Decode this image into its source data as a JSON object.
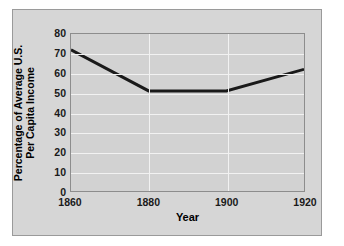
{
  "figure": {
    "panel_bg": "#d6d6d6",
    "plot_bg": "#d2d2d2",
    "grid_color": "#f2f2f2",
    "line_color": "#1a1a1a",
    "axis_color": "#8d8d8d",
    "caption_sliver": "............ ... .... .... ..... ...... ...."
  },
  "chart_data": {
    "type": "line",
    "title": "",
    "subtitle": "",
    "xlabel": "Year",
    "ylabel": "Percentage of Average U.S. Per Capita Income",
    "ylabel_line1": "Percentage of Average U.S.",
    "ylabel_line2": "Per Capita Income",
    "x": [
      1860,
      1880,
      1900,
      1920
    ],
    "values": [
      72,
      51,
      51,
      62
    ],
    "series": [
      {
        "name": "Percentage of Average U.S. Per Capita Income",
        "values": [
          72,
          51,
          51,
          62
        ]
      }
    ],
    "xlim": [
      1860,
      1920
    ],
    "ylim": [
      0,
      80
    ],
    "xticks": [
      1860,
      1880,
      1900,
      1920
    ],
    "xticklabels": [
      "1860",
      "1880",
      "1900",
      "1920"
    ],
    "yticks": [
      0,
      10,
      20,
      30,
      40,
      50,
      60,
      70,
      80
    ],
    "yticklabels": [
      "0",
      "10",
      "20",
      "30",
      "40",
      "50",
      "60",
      "70",
      "80"
    ],
    "grid": true,
    "grid_axis": "both",
    "legend": false,
    "legend_position": "none",
    "annotations": []
  }
}
